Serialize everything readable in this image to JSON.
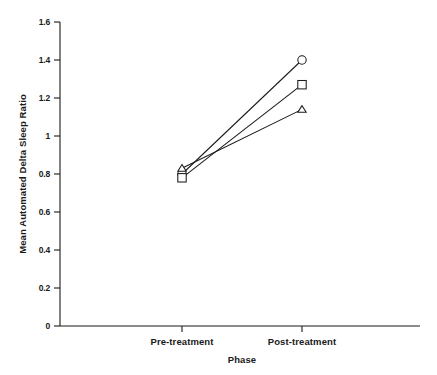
{
  "chart_data": {
    "type": "line",
    "title": "",
    "xlabel": "Phase",
    "ylabel": "Mean Automated Delta Sleep Ratio",
    "categories": [
      "Pre-treatment",
      "Post-treatment"
    ],
    "ylim": [
      0,
      1.6
    ],
    "ytick_labels": [
      "0",
      "0.2",
      "0.4",
      "0.6",
      "0.8",
      "1",
      "1.2",
      "1.4",
      "1.6"
    ],
    "ytick_values": [
      0,
      0.2,
      0.4,
      0.6,
      0.8,
      1.0,
      1.2,
      1.4,
      1.6
    ],
    "grid": false,
    "legend": "none",
    "series": [
      {
        "name": "circle-series",
        "marker": "circle",
        "values": [
          0.8,
          1.4
        ]
      },
      {
        "name": "square-series",
        "marker": "square",
        "values": [
          0.78,
          1.27
        ]
      },
      {
        "name": "triangle-series",
        "marker": "triangle",
        "values": [
          0.83,
          1.14
        ]
      }
    ],
    "colors": {
      "axis": "#1a1a1a",
      "line": "#1a1a1a",
      "marker_fill": "#ffffff",
      "background": "#ffffff"
    }
  },
  "axis": {
    "y_title": "Mean Automated Delta Sleep Ratio",
    "x_title": "Phase",
    "y_ticks": [
      "1.6",
      "1.4",
      "1.2",
      "1",
      "0.8",
      "0.6",
      "0.4",
      "0.2",
      "0"
    ],
    "x_ticks": [
      "Pre-treatment",
      "Post-treatment"
    ]
  }
}
